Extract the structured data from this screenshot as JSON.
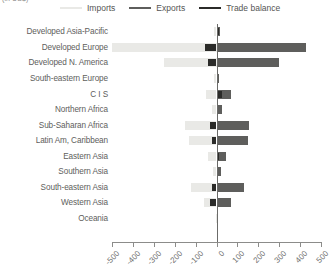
{
  "caption_fragment": "(in US$)",
  "legend": {
    "items": [
      {
        "label": "Imports",
        "color": "#e9e9e6",
        "icon": "line-swatch-icon"
      },
      {
        "label": "Exports",
        "color": "#5e5e5c",
        "icon": "line-swatch-icon"
      },
      {
        "label": "Trade balance",
        "color": "#2b2b29",
        "icon": "line-swatch-icon"
      }
    ]
  },
  "colors": {
    "imports": "#e9e9e6",
    "exports": "#5e5e5c",
    "balance": "#2b2b29",
    "axis": "#8c8c8a",
    "zero_line": "#6b6b69",
    "text": "#5e5e5c",
    "background": "#ffffff"
  },
  "chart_data": {
    "type": "bar",
    "orientation": "horizontal",
    "title": "",
    "subtitle": "",
    "xlabel": "",
    "ylabel": "",
    "xlim": [
      -500,
      500
    ],
    "xticks": [
      -500,
      -400,
      -300,
      -200,
      -100,
      0,
      100,
      200,
      300,
      400,
      500
    ],
    "xtick_labels": [
      "-500",
      "-400",
      "-300",
      "-200",
      "-100",
      "0",
      "100",
      "200",
      "300",
      "400",
      "500"
    ],
    "grid": false,
    "legend_position": "top",
    "categories": [
      "Developed Asia-Pacific",
      "Developed Europe",
      "Developed N. America",
      "South-eastern Europe",
      "C I S",
      "Northern Africa",
      "Sub-Saharan Africa",
      "Latin Am, Caribbean",
      "Eastern Asia",
      "Southern Asia",
      "South-eastern Asia",
      "Western Asia",
      "Oceania"
    ],
    "series": [
      {
        "name": "Imports",
        "color": "#e9e9e6",
        "values": [
          -12,
          -520,
          -250,
          -10,
          -50,
          -22,
          -150,
          -130,
          -40,
          -18,
          -120,
          -60,
          -3
        ]
      },
      {
        "name": "Exports",
        "color": "#5e5e5c",
        "values": [
          18,
          430,
          300,
          12,
          70,
          25,
          155,
          150,
          45,
          20,
          130,
          70,
          4
        ]
      },
      {
        "name": "Trade balance",
        "color": "#2b2b29",
        "values": [
          12,
          -55,
          -42,
          4,
          26,
          6,
          -32,
          -22,
          12,
          4,
          -20,
          -32,
          2
        ]
      }
    ]
  }
}
